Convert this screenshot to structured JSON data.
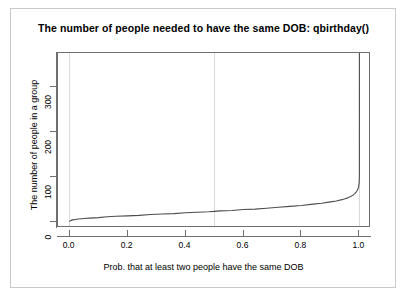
{
  "chart_data": {
    "type": "line",
    "title": "The number of people needed to have the same DOB: qbirthday()",
    "xlabel": "Prob. that at least two people have the same DOB",
    "ylabel": "The number of people in a group",
    "xlim": [
      -0.04,
      1.04
    ],
    "ylim": [
      -14,
      375
    ],
    "grid": true,
    "grid_lines_x": [
      0.0,
      0.5,
      1.0
    ],
    "legend": null,
    "xticks": [
      "0.0",
      "0.2",
      "0.4",
      "0.6",
      "0.8",
      "1.0"
    ],
    "xtick_values": [
      0.0,
      0.2,
      0.4,
      0.6,
      0.8,
      1.0
    ],
    "yticks": [
      "0",
      "100",
      "200",
      "300"
    ],
    "ytick_values": [
      0,
      100,
      200,
      300
    ],
    "series": [
      {
        "name": "qbirthday",
        "color": "#4d4d4d",
        "x": [
          0.0,
          0.005,
          0.01,
          0.02,
          0.03,
          0.05,
          0.07,
          0.1,
          0.13,
          0.16,
          0.2,
          0.24,
          0.28,
          0.32,
          0.36,
          0.4,
          0.44,
          0.48,
          0.5,
          0.52,
          0.56,
          0.6,
          0.64,
          0.68,
          0.72,
          0.76,
          0.8,
          0.84,
          0.87,
          0.9,
          0.92,
          0.94,
          0.95,
          0.96,
          0.97,
          0.975,
          0.98,
          0.985,
          0.99,
          0.993,
          0.995,
          0.996,
          0.997,
          0.998,
          0.9985,
          0.999,
          0.9993,
          0.9995,
          0.9997,
          0.9998,
          0.9999,
          0.99995,
          1.0
        ],
        "y": [
          1,
          3,
          4,
          5,
          6,
          7,
          8,
          9,
          11,
          12,
          13,
          14,
          16,
          17,
          18,
          20,
          21,
          22,
          23,
          24,
          25,
          27,
          28,
          30,
          32,
          34,
          36,
          39,
          41,
          44,
          46,
          49,
          51,
          53,
          56,
          58,
          60,
          63,
          67,
          70,
          73,
          75,
          77,
          81,
          83,
          86,
          89,
          91,
          95,
          98,
          105,
          112,
          374
        ]
      }
    ],
    "annotations": []
  },
  "figure": {
    "title": "The number of people needed to have the same DOB: qbirthday()",
    "x_axis_title": "Prob. that at least two people have the same DOB",
    "y_axis_title": "The number of people in a group"
  }
}
